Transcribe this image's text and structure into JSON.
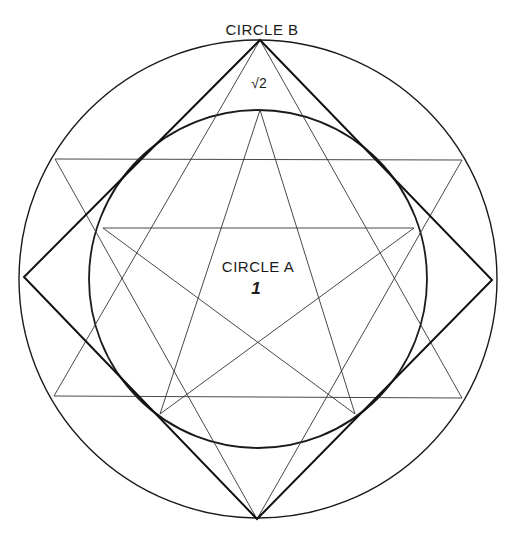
{
  "diagram": {
    "labels": {
      "circle_b": "CIRCLE B",
      "circle_b_value": "√2",
      "circle_a": "CIRCLE A",
      "circle_a_value": "1"
    },
    "colors": {
      "stroke": "#1a1a1a",
      "background": "#ffffff"
    },
    "outer_circle": {
      "name": "Circle B",
      "cx": 258,
      "cy": 279,
      "r": 239
    },
    "inner_circle": {
      "name": "Circle A",
      "cx": 258,
      "cy": 279,
      "r": 169
    },
    "square": {
      "points": [
        [
          260,
          40
        ],
        [
          492,
          280
        ],
        [
          257,
          519
        ],
        [
          24,
          277
        ]
      ]
    },
    "hexagram": {
      "triangle_up": [
        [
          260,
          40
        ],
        [
          462,
          398
        ],
        [
          54,
          396
        ]
      ],
      "triangle_down": [
        [
          55,
          159
        ],
        [
          462,
          160
        ],
        [
          257,
          519
        ]
      ]
    },
    "pentagram": {
      "points": [
        [
          260,
          110
        ],
        [
          414,
          228
        ],
        [
          355,
          414
        ],
        [
          160,
          414
        ],
        [
          103,
          228
        ]
      ]
    }
  }
}
